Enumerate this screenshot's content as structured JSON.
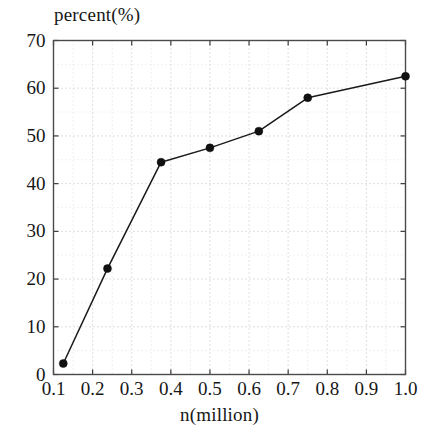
{
  "chart_data": {
    "type": "line",
    "title": "percent(%)",
    "xlabel": "n(million)",
    "ylabel": "percent(%)",
    "xlim": [
      0.1,
      1.0
    ],
    "ylim": [
      0,
      70
    ],
    "grid": true,
    "minor_grid": true,
    "legend": null,
    "marker": "filled-circle",
    "line_color": "#1a1a1a",
    "marker_color": "#111111",
    "x": [
      0.125,
      0.238,
      0.375,
      0.5,
      0.625,
      0.75,
      1.0
    ],
    "values": [
      2.3,
      22.2,
      44.5,
      47.5,
      51.0,
      58.0,
      62.5
    ],
    "series": [
      {
        "name": "percent",
        "points": [
          {
            "x": 0.125,
            "y": 2.3
          },
          {
            "x": 0.238,
            "y": 22.2
          },
          {
            "x": 0.375,
            "y": 44.5
          },
          {
            "x": 0.5,
            "y": 47.5
          },
          {
            "x": 0.625,
            "y": 51.0
          },
          {
            "x": 0.75,
            "y": 58.0
          },
          {
            "x": 1.0,
            "y": 62.5
          }
        ]
      }
    ],
    "yticks": [
      0,
      10,
      20,
      30,
      40,
      50,
      60,
      70
    ],
    "ytick_labels": [
      "0",
      "10",
      "20",
      "30",
      "40",
      "50",
      "60",
      "70"
    ],
    "xticks": [
      0.1,
      0.2,
      0.3,
      0.4,
      0.5,
      0.6,
      0.7,
      0.8,
      0.9,
      1.0
    ],
    "xtick_labels": [
      "0.1",
      "0.2",
      "0.3",
      "0.4",
      "0.5",
      "0.6",
      "0.7",
      "0.8",
      "0.9",
      "1.0"
    ]
  },
  "axes": {
    "frame_color": "#4a4a4a",
    "grid_color": "#b9b9b9"
  }
}
